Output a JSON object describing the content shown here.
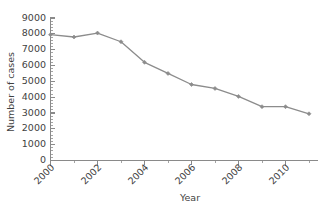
{
  "chart_data": {
    "type": "line",
    "title": "",
    "subtitle": "",
    "xlabel": "Year",
    "ylabel": "Number of cases",
    "x": [
      2000,
      2001,
      2002,
      2003,
      2004,
      2005,
      2006,
      2007,
      2008,
      2009,
      2010,
      2011
    ],
    "values": [
      7950,
      7800,
      8050,
      7500,
      6200,
      5500,
      4800,
      4550,
      4050,
      3400,
      3400,
      2950
    ],
    "series": [
      {
        "name": "Number of cases",
        "values": [
          7950,
          7800,
          8050,
          7500,
          6200,
          5500,
          4800,
          4550,
          4050,
          3400,
          3400,
          2950
        ]
      }
    ],
    "xlim": [
      2000,
      2011.6
    ],
    "ylim": [
      0,
      9000
    ],
    "y_ticks": [
      0,
      1000,
      2000,
      3000,
      4000,
      5000,
      6000,
      7000,
      8000,
      9000
    ],
    "y_tick_labels": [
      "0",
      "1000",
      "2000",
      "3000",
      "4000",
      "5000",
      "6000",
      "7000",
      "8000",
      "9000"
    ],
    "y_minor_tick_step": 200,
    "x_ticks": [
      2000,
      2001,
      2002,
      2003,
      2004,
      2005,
      2006,
      2007,
      2008,
      2009,
      2010,
      2011
    ],
    "x_tick_labels": [
      "2000",
      "",
      "2002",
      "",
      "2004",
      "",
      "2006",
      "",
      "2008",
      "",
      "2010",
      ""
    ],
    "x_labeled_ticks": [
      "2000",
      "2002",
      "2004",
      "2006",
      "2008",
      "2010"
    ],
    "x_tick_label_rotation": 45,
    "grid": false,
    "legend": false,
    "legend_position": "none",
    "marker": "diamond",
    "colors": {
      "line": "#8c8c8c",
      "marker": "#8c8c8c",
      "axis": "#8a8a8a",
      "text": "#3f3f3f",
      "background": "#ffffff"
    },
    "annotations": []
  }
}
